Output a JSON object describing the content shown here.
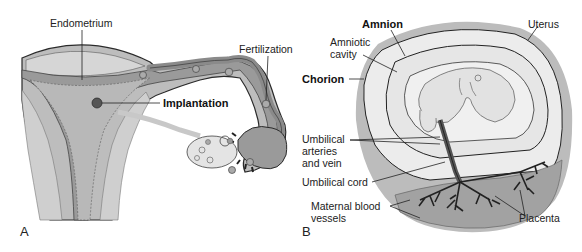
{
  "figure": {
    "panels": [
      {
        "id": "A",
        "letter": "A",
        "labels": {
          "endometrium": "Endometrium",
          "fertilization": "Fertilization",
          "implantation": "Implantation"
        }
      },
      {
        "id": "B",
        "letter": "B",
        "labels": {
          "amnion": "Amnion",
          "uterus": "Uterus",
          "amniotic_cavity": "Amniotic\ncavity",
          "chorion": "Chorion",
          "umbilical_vessels": "Umbilical\narteries\nand vein",
          "umbilical_cord": "Umbilical cord",
          "maternal_vessels": "Maternal blood\nvessels",
          "placenta": "Placenta"
        }
      }
    ],
    "colors": {
      "tissue_light": "#d4d4d4",
      "tissue_mid": "#a8a8a8",
      "tissue_dark": "#8c8c8c",
      "lining": "#e9e9e9",
      "outline": "#2a2a2a",
      "uterus_wall": "#bdbdbd"
    }
  }
}
